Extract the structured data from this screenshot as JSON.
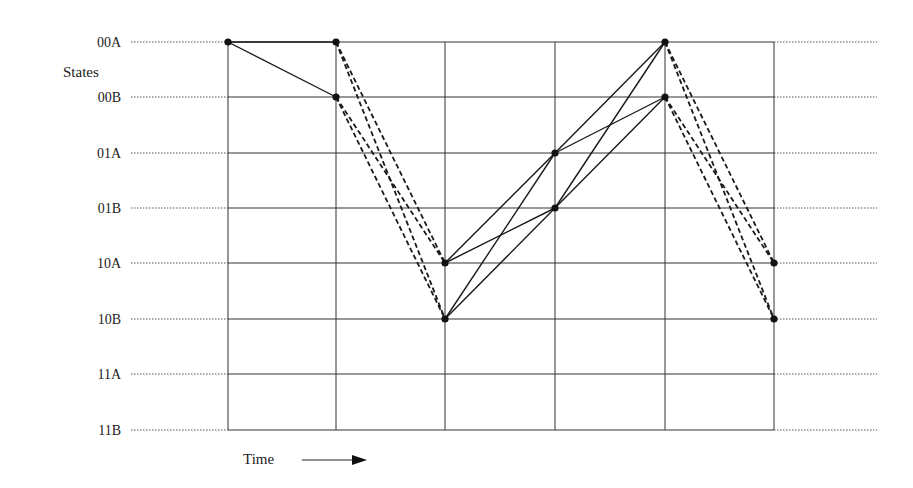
{
  "diagram": {
    "title": "",
    "y_axis_title": "States",
    "x_axis_title": "Time",
    "x_axis_arrow": "right-arrow-icon",
    "states": [
      "00A",
      "00B",
      "01A",
      "01B",
      "10A",
      "10B",
      "11A",
      "11B"
    ],
    "time_steps": 6,
    "nodes": [
      {
        "t": 0,
        "state": "00A"
      },
      {
        "t": 1,
        "state": "00A"
      },
      {
        "t": 1,
        "state": "00B"
      },
      {
        "t": 2,
        "state": "10A"
      },
      {
        "t": 2,
        "state": "10B"
      },
      {
        "t": 3,
        "state": "01A"
      },
      {
        "t": 3,
        "state": "01B"
      },
      {
        "t": 4,
        "state": "00A"
      },
      {
        "t": 4,
        "state": "00B"
      },
      {
        "t": 5,
        "state": "10A"
      },
      {
        "t": 5,
        "state": "10B"
      }
    ],
    "transitions": [
      {
        "from": [
          0,
          "00A"
        ],
        "to": [
          1,
          "00A"
        ],
        "style": "solid"
      },
      {
        "from": [
          0,
          "00A"
        ],
        "to": [
          1,
          "00B"
        ],
        "style": "solid"
      },
      {
        "from": [
          1,
          "00A"
        ],
        "to": [
          2,
          "10A"
        ],
        "style": "dashed"
      },
      {
        "from": [
          1,
          "00A"
        ],
        "to": [
          2,
          "10B"
        ],
        "style": "dashed"
      },
      {
        "from": [
          1,
          "00B"
        ],
        "to": [
          2,
          "10A"
        ],
        "style": "dashed"
      },
      {
        "from": [
          1,
          "00B"
        ],
        "to": [
          2,
          "10B"
        ],
        "style": "dashed"
      },
      {
        "from": [
          2,
          "10A"
        ],
        "to": [
          3,
          "01A"
        ],
        "style": "solid"
      },
      {
        "from": [
          2,
          "10A"
        ],
        "to": [
          3,
          "01B"
        ],
        "style": "solid"
      },
      {
        "from": [
          2,
          "10B"
        ],
        "to": [
          3,
          "01A"
        ],
        "style": "solid"
      },
      {
        "from": [
          2,
          "10B"
        ],
        "to": [
          3,
          "01B"
        ],
        "style": "solid"
      },
      {
        "from": [
          3,
          "01A"
        ],
        "to": [
          4,
          "00A"
        ],
        "style": "solid"
      },
      {
        "from": [
          3,
          "01A"
        ],
        "to": [
          4,
          "00B"
        ],
        "style": "solid"
      },
      {
        "from": [
          3,
          "01B"
        ],
        "to": [
          4,
          "00A"
        ],
        "style": "solid"
      },
      {
        "from": [
          3,
          "01B"
        ],
        "to": [
          4,
          "00B"
        ],
        "style": "solid"
      },
      {
        "from": [
          4,
          "00A"
        ],
        "to": [
          5,
          "10A"
        ],
        "style": "dashed"
      },
      {
        "from": [
          4,
          "00A"
        ],
        "to": [
          5,
          "10B"
        ],
        "style": "dashed"
      },
      {
        "from": [
          4,
          "00B"
        ],
        "to": [
          5,
          "10A"
        ],
        "style": "dashed"
      },
      {
        "from": [
          4,
          "00B"
        ],
        "to": [
          5,
          "10B"
        ],
        "style": "dashed"
      }
    ]
  },
  "colors": {
    "line": "#1a1a1a",
    "grid": "#333333",
    "background": "#ffffff"
  }
}
